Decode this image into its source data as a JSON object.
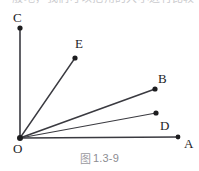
{
  "page": {
    "width": 199,
    "height": 171,
    "background": "#ffffff",
    "top_text_strip": "一般地，我们可以把角的大小进行比较"
  },
  "figure": {
    "caption_cjk": "图",
    "caption_number": "1.3-9",
    "stroke_color": "#3a3a40",
    "point_color": "#1d1d1f",
    "label_color": "#1d1d1f",
    "caption_color": "#8d8d92",
    "vertex": {
      "name": "O",
      "label": "O",
      "x": 20,
      "y": 138
    },
    "rays": [
      {
        "name": "OC",
        "endpoint_label": "C",
        "from": [
          20,
          138
        ],
        "to": [
          20,
          28
        ],
        "stroke_width": 1.6
      },
      {
        "name": "OE",
        "endpoint_label": "E",
        "from": [
          20,
          138
        ],
        "to": [
          75,
          58
        ],
        "stroke_width": 1.4
      },
      {
        "name": "OB",
        "endpoint_label": "B",
        "from": [
          20,
          138
        ],
        "to": [
          155,
          89
        ],
        "stroke_width": 1.6
      },
      {
        "name": "OD",
        "endpoint_label": "D",
        "from": [
          20,
          138
        ],
        "to": [
          156,
          113
        ],
        "stroke_width": 1.2
      },
      {
        "name": "OA",
        "endpoint_label": "A",
        "from": [
          20,
          138
        ],
        "to": [
          178,
          137
        ],
        "stroke_width": 1.3
      }
    ],
    "points": [
      {
        "name": "C",
        "label": "C",
        "x": 20,
        "y": 28,
        "r": 2.6
      },
      {
        "name": "E",
        "label": "E",
        "x": 75,
        "y": 58,
        "r": 2.6
      },
      {
        "name": "B",
        "label": "B",
        "x": 155,
        "y": 89,
        "r": 2.6
      },
      {
        "name": "D",
        "label": "D",
        "x": 156,
        "y": 113,
        "r": 2.6
      },
      {
        "name": "A",
        "label": "A",
        "x": 178,
        "y": 137,
        "r": 2.4
      },
      {
        "name": "O",
        "label": "O",
        "x": 20,
        "y": 138,
        "r": 3.0
      }
    ],
    "labels": {
      "A": "A",
      "B": "B",
      "C": "C",
      "D": "D",
      "E": "E",
      "O": "O"
    }
  }
}
